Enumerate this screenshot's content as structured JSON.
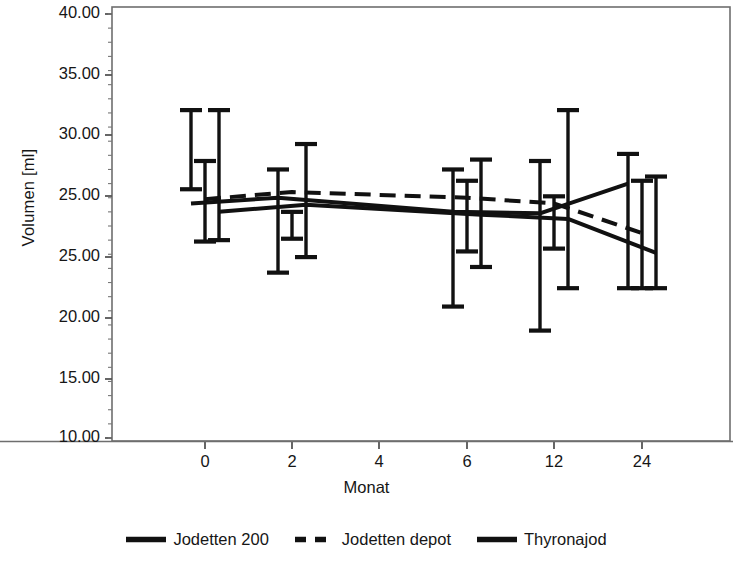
{
  "chart_data": {
    "type": "line",
    "title": "",
    "xlabel": "Monat",
    "ylabel": "Volumen [ml]",
    "categories": [
      "0",
      "2",
      "4",
      "6",
      "12",
      "24"
    ],
    "x_tick_labels": [
      "0",
      "2",
      "4",
      "6",
      "12",
      "24"
    ],
    "y_tick_labels": [
      "40.00",
      "35.00",
      "30.00",
      "25.00",
      "25.00",
      "20.00",
      "15.00",
      "10.00"
    ],
    "y_tick_values": [
      40.0,
      35.0,
      30.0,
      27.0,
      25.0,
      20.0,
      15.0,
      10.0
    ],
    "ylim": [
      10.0,
      40.0
    ],
    "grid": false,
    "minor_ticks": true,
    "error_bars": "mean with upper/lower whiskers",
    "legend_position": "bottom",
    "series": [
      {
        "name": "Jodetten 200",
        "style": "solid",
        "color": "#111111",
        "values": [
          26.6,
          27.0,
          null,
          26.0,
          25.9,
          28.0
        ],
        "upper": [
          33.2,
          29.0,
          null,
          29.0,
          29.6,
          30.1
        ],
        "lower": [
          27.6,
          21.7,
          null,
          19.3,
          17.6,
          20.6
        ]
      },
      {
        "name": "Jodetten depot",
        "style": "dashed",
        "color": "#111111",
        "values": [
          26.9,
          27.4,
          null,
          27.0,
          26.6,
          24.5
        ],
        "upper": [
          29.6,
          26.0,
          null,
          28.2,
          27.1,
          28.2
        ],
        "lower": [
          23.9,
          24.1,
          null,
          23.2,
          23.4,
          20.6
        ]
      },
      {
        "name": "Thyronajod",
        "style": "solid",
        "color": "#111111",
        "values": [
          26.0,
          26.5,
          null,
          25.8,
          25.5,
          23.1
        ],
        "upper": [
          33.2,
          30.8,
          null,
          29.7,
          33.2,
          28.5
        ],
        "lower": [
          24.0,
          22.8,
          null,
          22.1,
          20.6,
          20.6
        ]
      }
    ]
  },
  "axes": {
    "y_title": "Volumen [ml]",
    "x_title": "Monat",
    "y_ticks": [
      {
        "label": "40.00",
        "y": 14
      },
      {
        "label": "35.00",
        "y": 75
      },
      {
        "label": "30.00",
        "y": 135
      },
      {
        "label": "25.00",
        "y": 196
      },
      {
        "label": "25.00",
        "y": 257
      },
      {
        "label": "20.00",
        "y": 318
      },
      {
        "label": "15.00",
        "y": 379
      },
      {
        "label": "10.00",
        "y": 438
      }
    ],
    "x_ticks": [
      {
        "label": "0",
        "x": 205
      },
      {
        "label": "2",
        "x": 292
      },
      {
        "label": "4",
        "x": 379
      },
      {
        "label": "6",
        "x": 467
      },
      {
        "label": "12",
        "x": 554
      },
      {
        "label": "24",
        "x": 642
      }
    ]
  },
  "legend": {
    "items": [
      {
        "label": "Jodetten 200",
        "style": "solid",
        "icon": "line-solid-icon"
      },
      {
        "label": "Jodetten depot",
        "style": "dashed",
        "icon": "line-dashed-icon"
      },
      {
        "label": "Thyronajod",
        "style": "solid",
        "icon": "line-solid-icon"
      }
    ]
  }
}
